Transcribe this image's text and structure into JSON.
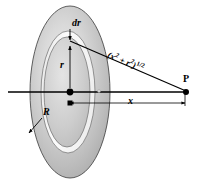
{
  "figure": {
    "labels": {
      "ring_thickness": "dr",
      "ring_radius": "r",
      "disk_radius": "R",
      "axial_distance": "x",
      "field_point": "P",
      "hypotenuse_base": "(x",
      "hypotenuse_exp1": "2",
      "hypotenuse_plus": " + r",
      "hypotenuse_exp2": "2",
      "hypotenuse_close": ")",
      "hypotenuse_power": "1/2",
      "hypotenuse_full": "(x2 + r2)1/2"
    },
    "colors": {
      "stroke": "#000000",
      "disk_light": "#e8e8e8",
      "disk_mid": "#b8b8b8",
      "disk_dark": "#9a9a9a",
      "ring_highlight": "#f2f2f2",
      "background": "#ffffff"
    },
    "geometry": {
      "disk_center_x": 70,
      "disk_center_y": 92,
      "disk_rx": 40,
      "disk_ry": 86,
      "ring_outer_rx": 26,
      "ring_outer_ry": 60,
      "ring_inner_rx": 22,
      "ring_inner_ry": 54,
      "point_p_x": 186,
      "point_p_y": 92,
      "dimension_line_y": 103
    }
  }
}
